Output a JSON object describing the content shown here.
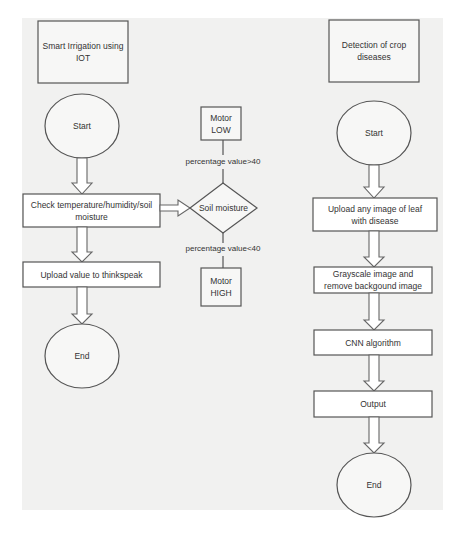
{
  "diagram": {
    "type": "flowchart",
    "left_flow": {
      "title": "Smart Irrigation using IOT",
      "title_lines": [
        "Smart Irrigation using",
        "IOT"
      ],
      "start": "Start",
      "check": "Check temperature/humidity/soil moisture",
      "upload": "Upload value to thinkspeak",
      "end": "End",
      "decision": {
        "label": "Soil moisture",
        "high_branch_label": "percentage value>40",
        "low_branch_label": "percentage value<40",
        "motor_low": "Motor LOW",
        "motor_low_lines": [
          "Motor",
          "LOW"
        ],
        "motor_high": "Motor HIGH",
        "motor_high_lines": [
          "Motor",
          "HIGH"
        ]
      }
    },
    "right_flow": {
      "title": "Detection of crop diseases",
      "title_lines": [
        "Detection of crop",
        "diseases"
      ],
      "start": "Start",
      "upload": "Upload any image of leaf with disease",
      "grayscale": "Grayscale image and remove backgound image",
      "cnn": "CNN algorithm",
      "output": "Output",
      "end": "End"
    },
    "colors": {
      "background": "#f1f1f0",
      "stroke": "#555555",
      "text": "#333333"
    }
  }
}
